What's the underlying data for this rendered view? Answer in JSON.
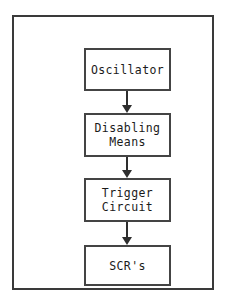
{
  "diagram": {
    "type": "flowchart",
    "orientation": "vertical-top-down",
    "frame_color": "#3a3a3a",
    "box_border_color": "#444444",
    "arrow_color": "#2e2e2e",
    "text_color": "#1a1a1a",
    "background_color": "#ffffff",
    "nodes": [
      {
        "id": "oscillator",
        "label": "Oscillator"
      },
      {
        "id": "disabling-means",
        "label": "Disabling\nMeans"
      },
      {
        "id": "trigger-circuit",
        "label": "Trigger\nCircuit"
      },
      {
        "id": "scrs",
        "label": "SCR's"
      }
    ],
    "connectors": [
      {
        "id": "connector-1",
        "from": "oscillator",
        "to": "disabling-means",
        "glyph": "arrow-down-icon"
      },
      {
        "id": "connector-2",
        "from": "disabling-means",
        "to": "trigger-circuit",
        "glyph": "arrow-down-icon"
      },
      {
        "id": "connector-3",
        "from": "trigger-circuit",
        "to": "scrs",
        "glyph": "arrow-down-icon"
      }
    ]
  }
}
